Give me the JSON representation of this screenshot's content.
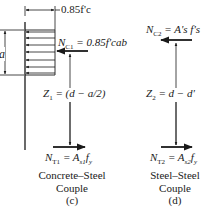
{
  "diagram": {
    "panel_c": {
      "stress_label": "0.85f'c",
      "depth_label": "a",
      "compression_force": {
        "symbol": "NC1",
        "text": "N",
        "sub": "C1",
        "expr": "= 0.85f'cab"
      },
      "lever_arm": {
        "text": "Z",
        "sub": "1",
        "expr": "= (d − a/2)"
      },
      "tension_force": {
        "text": "N",
        "sub": "T1",
        "expr": "= A",
        "expr_sub": "s1",
        "expr_tail": "f",
        "expr_tail_sub": "y"
      },
      "caption_line1": "Concrete–Steel",
      "caption_line2": "Couple",
      "caption_tag": "(c)"
    },
    "panel_d": {
      "compression_force": {
        "text": "N",
        "sub": "C2",
        "expr": "= A's f's"
      },
      "lever_arm": {
        "text": "Z",
        "sub": "2",
        "expr": "= d − d'"
      },
      "tension_force": {
        "text": "N",
        "sub": "T2",
        "expr": "= A",
        "expr_sub": "s2",
        "expr_tail": "f",
        "expr_tail_sub": "y"
      },
      "caption_line1": "Steel–Steel",
      "caption_line2": "Couple",
      "caption_tag": "(d)"
    },
    "colors": {
      "ink": "#1a1a1a",
      "background": "#ffffff"
    }
  }
}
